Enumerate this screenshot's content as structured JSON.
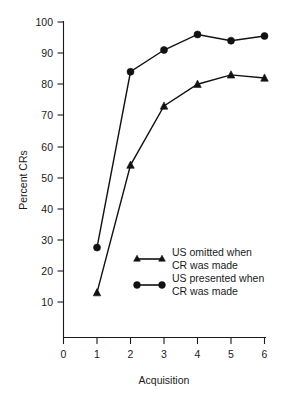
{
  "chart_data": {
    "type": "line",
    "title": "",
    "xlabel": "Acquisition",
    "ylabel": "Percent CRs",
    "x": [
      1,
      2,
      3,
      4,
      5,
      6
    ],
    "xlim": [
      0,
      6
    ],
    "ylim": [
      0,
      100
    ],
    "xticks": [
      "0",
      "1",
      "2",
      "3",
      "4",
      "5",
      "6"
    ],
    "yticks": [
      "10",
      "20",
      "30",
      "40",
      "50",
      "60",
      "70",
      "80",
      "90",
      "100"
    ],
    "grid": false,
    "legend_position": "center-right-inside",
    "series": [
      {
        "name": "US omitted when CR was made",
        "marker": "triangle",
        "values": [
          13,
          54,
          73,
          80,
          83,
          82
        ]
      },
      {
        "name": "US presented when CR was made",
        "marker": "circle",
        "values": [
          27.5,
          84,
          91,
          96,
          94,
          95.5
        ]
      }
    ]
  },
  "axes": {
    "y_title": "Percent CRs",
    "x_title": "Acquisition",
    "y_tick_labels": [
      "100",
      "90",
      "80",
      "70",
      "60",
      "50",
      "40",
      "30",
      "20",
      "10"
    ],
    "x_tick_labels": [
      "0",
      "1",
      "2",
      "3",
      "4",
      "5",
      "6"
    ]
  },
  "legend": {
    "entries": [
      {
        "marker": "triangle-marker",
        "line1": "US omitted when",
        "line2": "CR was made"
      },
      {
        "marker": "circle-marker",
        "line1": "US presented when",
        "line2": "CR was made"
      }
    ]
  },
  "colors": {
    "ink": "#111111",
    "background": "#ffffff"
  }
}
